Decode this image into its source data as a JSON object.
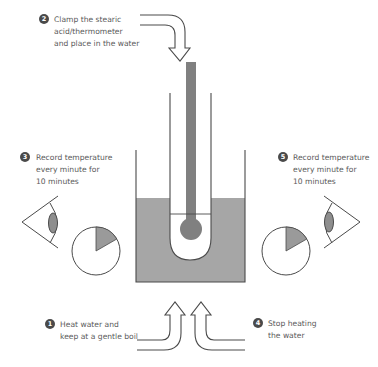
{
  "colors": {
    "stroke": "#4a4a4a",
    "fill_gray": "#9a9a9a",
    "thermometer": "#808080",
    "badge": "#4a4a4a",
    "text": "#5a5a5a"
  },
  "steps": [
    {
      "number": "1",
      "lines": [
        "Heat water and",
        "keep at a gentle boil"
      ]
    },
    {
      "number": "2",
      "lines": [
        "Clamp the stearic",
        "acid/thermometer",
        "and place in the water"
      ]
    },
    {
      "number": "3",
      "lines": [
        "Record temperature",
        "every minute for",
        "10 minutes"
      ]
    },
    {
      "number": "4",
      "lines": [
        "Stop heating",
        "the water"
      ]
    },
    {
      "number": "5",
      "lines": [
        "Record temperature",
        "every minute for",
        "10 minutes"
      ]
    }
  ],
  "icons": {
    "left_eye": "eye-icon",
    "right_eye": "eye-icon",
    "left_clock": "clock-icon",
    "right_clock": "clock-icon",
    "clock_elapsed_fraction": 0.1667
  }
}
